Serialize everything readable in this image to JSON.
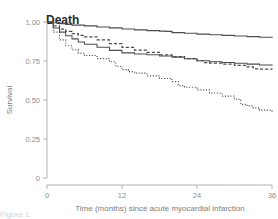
{
  "figure": {
    "panel_title": "Death",
    "caption_partial": "Figure 1."
  },
  "axes": {
    "y_title": "Survival",
    "x_title": "Time (months) since acute myocardial infarction",
    "y_ticks": [
      "1.00",
      "0.75",
      "0.50",
      "0.25",
      "0"
    ],
    "x_ticks": [
      "0",
      "12",
      "24",
      "36"
    ]
  },
  "colors": {
    "curve": "#4d4d4d",
    "axis": "#b4b4b4",
    "tick_text": "#8d8d8d",
    "title_text": "#2b2b2b",
    "background": "#ffffff"
  },
  "chart_data": {
    "type": "line",
    "title": "Death",
    "xlabel": "Time (months) since acute myocardial infarction",
    "ylabel": "Survival",
    "xlim": [
      0,
      36
    ],
    "ylim": [
      0,
      1.0
    ],
    "xticks": [
      0,
      12,
      24,
      36
    ],
    "yticks": [
      0,
      0.25,
      0.5,
      0.75,
      1.0
    ],
    "grid": false,
    "legend": "none",
    "curve_style_note": "Four Kaplan-Meier step curves: solid (highest), dashed, solid (mid), dotted (lowest)",
    "series": [
      {
        "name": "curve-1-solid-top",
        "style": "solid",
        "x": [
          0,
          1,
          2,
          3,
          4,
          6,
          8,
          10,
          12,
          14,
          16,
          18,
          19,
          20,
          22,
          24,
          26,
          28,
          30,
          32,
          34,
          36
        ],
        "y": [
          1.0,
          0.995,
          0.99,
          0.985,
          0.98,
          0.975,
          0.968,
          0.962,
          0.955,
          0.95,
          0.945,
          0.942,
          0.94,
          0.932,
          0.928,
          0.922,
          0.918,
          0.914,
          0.91,
          0.906,
          0.902,
          0.898
        ]
      },
      {
        "name": "curve-2-dashed",
        "style": "dashed",
        "x": [
          0,
          1,
          2,
          3,
          4,
          5,
          6,
          8,
          10,
          12,
          14,
          16,
          18,
          20,
          22,
          24,
          25,
          26,
          28,
          30,
          32,
          33,
          34,
          36
        ],
        "y": [
          1.0,
          0.975,
          0.955,
          0.94,
          0.925,
          0.915,
          0.905,
          0.885,
          0.862,
          0.838,
          0.82,
          0.805,
          0.79,
          0.778,
          0.765,
          0.752,
          0.74,
          0.736,
          0.73,
          0.722,
          0.712,
          0.7,
          0.698,
          0.695
        ]
      },
      {
        "name": "curve-3-solid-mid",
        "style": "solid",
        "x": [
          0,
          1,
          2,
          3,
          4,
          5,
          6,
          8,
          10,
          12,
          14,
          16,
          18,
          20,
          22,
          24,
          26,
          28,
          30,
          32,
          34,
          36
        ],
        "y": [
          1.0,
          0.962,
          0.935,
          0.912,
          0.892,
          0.872,
          0.858,
          0.838,
          0.818,
          0.802,
          0.795,
          0.79,
          0.782,
          0.775,
          0.765,
          0.752,
          0.745,
          0.74,
          0.735,
          0.73,
          0.725,
          0.72
        ]
      },
      {
        "name": "curve-4-dotted",
        "style": "dotted",
        "x": [
          0,
          1,
          2,
          3,
          4,
          5,
          6,
          8,
          10,
          11,
          12,
          13,
          14,
          16,
          18,
          20,
          21,
          22,
          24,
          26,
          28,
          30,
          31,
          32,
          33,
          34,
          36
        ],
        "y": [
          1.0,
          0.935,
          0.885,
          0.848,
          0.822,
          0.8,
          0.785,
          0.765,
          0.745,
          0.715,
          0.695,
          0.682,
          0.672,
          0.655,
          0.638,
          0.618,
          0.592,
          0.582,
          0.565,
          0.545,
          0.525,
          0.505,
          0.472,
          0.462,
          0.45,
          0.435,
          0.42
        ]
      }
    ]
  }
}
